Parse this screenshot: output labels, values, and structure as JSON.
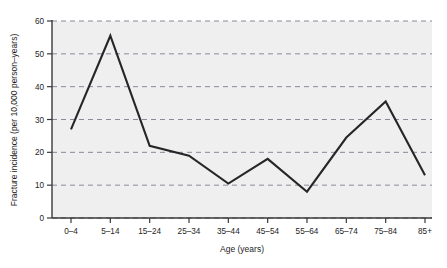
{
  "chart_data": {
    "type": "line",
    "title": "",
    "xlabel": "Age (years)",
    "ylabel": "Fracture incidence (per 10,000 person–years)",
    "categories": [
      "0–4",
      "5–14",
      "15–24",
      "25–34",
      "35–44",
      "45–54",
      "55–64",
      "65–74",
      "75–84",
      "85+"
    ],
    "values": [
      27,
      55.5,
      22,
      19,
      10.5,
      18,
      8,
      24.5,
      35.5,
      13
    ],
    "series": [
      {
        "name": "Fracture incidence",
        "values": [
          27,
          55.5,
          22,
          19,
          10.5,
          18,
          8,
          24.5,
          35.5,
          13
        ]
      }
    ],
    "ylim": [
      0,
      60
    ],
    "yticks": [
      0,
      10,
      20,
      30,
      40,
      50,
      60
    ],
    "ytick_labels": [
      "0",
      "10",
      "20",
      "30",
      "40",
      "50",
      "60"
    ],
    "grid": true,
    "grid_style": "dashed",
    "grid_axis": "y",
    "legend": false,
    "legend_position": "none",
    "plot_background": "#efefef",
    "line_color": "#262626",
    "grid_color": "#8a8a99",
    "axis_color": "#3a3a3a",
    "line_width": 2.1
  }
}
